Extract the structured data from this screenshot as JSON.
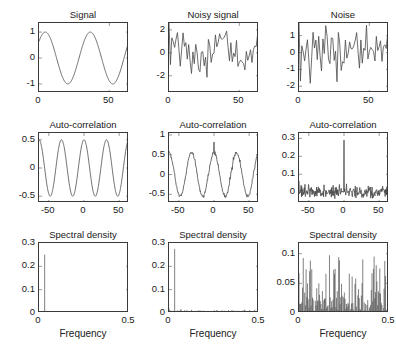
{
  "figure": {
    "rows": 3,
    "cols": 3,
    "background": "#ffffff",
    "line_color": "#4a4a4a",
    "axis_color": "#3a3a3a",
    "caption": ""
  },
  "chart_data": [
    {
      "id": "signal",
      "type": "line",
      "title": "Signal",
      "xlabel": "",
      "ylabel": "",
      "xlim": [
        0,
        64
      ],
      "ylim": [
        -1.35,
        1.35
      ],
      "xticks": [
        0,
        50
      ],
      "xticklabels": [
        "0",
        "50"
      ],
      "yticks": [
        -1,
        0,
        1
      ],
      "yticklabels": [
        "-1",
        "0",
        "1"
      ],
      "grid": false,
      "legend": "none",
      "description": "Pure sinusoid, about two cycles across 64 samples, amplitude 1",
      "series": [
        {
          "name": "signal",
          "generator": "sine",
          "amplitude": 1.0,
          "cycles": 2.0,
          "phase": 0.0,
          "n": 300
        }
      ]
    },
    {
      "id": "noisy-signal",
      "type": "line",
      "title": "Noisy signal",
      "xlabel": "",
      "ylabel": "",
      "xlim": [
        0,
        64
      ],
      "ylim": [
        -3.5,
        2.6
      ],
      "xticks": [
        0,
        50
      ],
      "xticklabels": [
        "0",
        "50"
      ],
      "yticks": [
        -2,
        0,
        2
      ],
      "yticklabels": [
        "-2",
        "0",
        "2"
      ],
      "grid": false,
      "legend": "none",
      "description": "Sinusoid plus white noise, amplitude 1 sine with noise sigma about 0.8",
      "series": [
        {
          "name": "signal+noise",
          "generator": "sine-plus-noise",
          "amplitude": 1.0,
          "cycles": 2.0,
          "noise_sigma": 0.85,
          "n": 65,
          "seed": 7
        }
      ]
    },
    {
      "id": "noise",
      "type": "line",
      "title": "Noise",
      "xlabel": "",
      "ylabel": "",
      "xlim": [
        0,
        64
      ],
      "ylim": [
        -2.4,
        1.75
      ],
      "xticks": [
        0,
        50
      ],
      "xticklabels": [
        "0",
        "50"
      ],
      "yticks": [
        -2,
        -1,
        0,
        1
      ],
      "yticklabels": [
        "-2",
        "-1",
        "0",
        "1"
      ],
      "grid": false,
      "legend": "none",
      "description": "White noise only, sigma about 0.8",
      "series": [
        {
          "name": "noise",
          "generator": "noise",
          "noise_sigma": 0.8,
          "n": 65,
          "seed": 7
        }
      ]
    },
    {
      "id": "autocorr-signal",
      "type": "line",
      "title": "Auto-correlation",
      "xlabel": "",
      "ylabel": "",
      "xlim": [
        -64,
        64
      ],
      "ylim": [
        -0.62,
        0.62
      ],
      "xticks": [
        -50,
        0,
        50
      ],
      "xticklabels": [
        "-50",
        "0",
        "50"
      ],
      "yticks": [
        -0.5,
        0,
        0.5
      ],
      "yticklabels": [
        "-0.5",
        "0",
        "0.5"
      ],
      "grid": false,
      "legend": "none",
      "description": "Triangular-windowed cosine autocorrelation of the pure sine, four visible cycles, peaks 0.5",
      "series": [
        {
          "name": "acf-signal",
          "generator": "cosine-acf",
          "amplitude": 0.5,
          "cycles_over_range": 4.0,
          "n": 400
        }
      ]
    },
    {
      "id": "autocorr-noisy",
      "type": "line",
      "title": "Auto-correlation",
      "xlabel": "",
      "ylabel": "",
      "xlim": [
        -64,
        64
      ],
      "ylim": [
        -0.72,
        1.05
      ],
      "xticks": [
        -50,
        0,
        50
      ],
      "xticklabels": [
        "-50",
        "0",
        "50"
      ],
      "yticks": [
        -0.5,
        0,
        0.5,
        1
      ],
      "yticklabels": [
        "-0.5",
        "0",
        "0.5",
        "1"
      ],
      "grid": false,
      "legend": "none",
      "description": "Cosine autocorrelation of the noisy signal with a narrow spike of 0.82 at lag 0",
      "series": [
        {
          "name": "acf-noisy",
          "generator": "cosine-acf-spike",
          "amplitude": 0.55,
          "cycles_over_range": 4.0,
          "spike_value": 0.82,
          "noise_sigma": 0.025,
          "n": 257,
          "seed": 11
        }
      ]
    },
    {
      "id": "autocorr-noise",
      "type": "line",
      "title": "Auto-correlation",
      "xlabel": "",
      "ylabel": "",
      "xlim": [
        -64,
        64
      ],
      "ylim": [
        -0.06,
        0.33
      ],
      "xticks": [
        -50,
        0,
        50
      ],
      "xticklabels": [
        "-50",
        "0",
        "50"
      ],
      "yticks": [
        0,
        0.1,
        0.2,
        0.3
      ],
      "yticklabels": [
        "0",
        "0.1",
        "0.2",
        "0.3"
      ],
      "grid": false,
      "legend": "none",
      "description": "Noise autocorrelation: flat noisy floor near 0 with a single spike of 0.29 at lag 0",
      "series": [
        {
          "name": "acf-noise",
          "generator": "noise-acf-spike",
          "spike_value": 0.29,
          "noise_sigma": 0.016,
          "n": 257,
          "seed": 3
        }
      ]
    },
    {
      "id": "psd-signal",
      "type": "line",
      "title": "Spectral density",
      "xlabel": "Frequency",
      "ylabel": "",
      "xlim": [
        0,
        0.5
      ],
      "ylim": [
        0,
        0.3
      ],
      "xticks": [
        0,
        0.5
      ],
      "xticklabels": [
        "0",
        "0.5"
      ],
      "yticks": [
        0,
        0.1,
        0.2,
        0.3
      ],
      "yticklabels": [
        "0",
        "0.1",
        "0.2",
        "0.3"
      ],
      "grid": false,
      "legend": "none",
      "description": "Single spectral line at frequency 0.031 with height 0.25, zero elsewhere",
      "series": [
        {
          "name": "psd-signal",
          "generator": "spike-only",
          "spike_freq": 0.031,
          "spike_value": 0.25,
          "floor": 0.0,
          "n": 128
        }
      ]
    },
    {
      "id": "psd-noisy",
      "type": "line",
      "title": "Spectral density",
      "xlabel": "Frequency",
      "ylabel": "",
      "xlim": [
        0,
        0.5
      ],
      "ylim": [
        0,
        0.3
      ],
      "xticks": [
        0,
        0.5
      ],
      "xticklabels": [
        "0",
        "0.5"
      ],
      "yticks": [
        0,
        0.1,
        0.2,
        0.3
      ],
      "yticklabels": [
        "0",
        "0.1",
        "0.2",
        "0.3"
      ],
      "grid": false,
      "legend": "none",
      "description": "Single spectral line at frequency 0.031 with height 0.275 over a low noise floor",
      "series": [
        {
          "name": "psd-noisy",
          "generator": "spike-plus-floor",
          "spike_freq": 0.031,
          "spike_value": 0.275,
          "floor": 0.006,
          "floor_sigma": 0.004,
          "n": 128,
          "seed": 5
        }
      ]
    },
    {
      "id": "psd-noise",
      "type": "line",
      "title": "Spectral density",
      "xlabel": "Frequency",
      "ylabel": "",
      "xlim": [
        0,
        0.5
      ],
      "ylim": [
        0,
        0.118
      ],
      "xticks": [
        0,
        0.5
      ],
      "xticklabels": [
        "0",
        "0.5"
      ],
      "yticks": [
        0,
        0.05,
        0.1
      ],
      "yticklabels": [
        "0",
        "0.05",
        "0.1"
      ],
      "grid": false,
      "legend": "none",
      "description": "Dense ragged white-noise periodogram filling 0 to 0.11, mean about 0.03, max about 0.105",
      "series": [
        {
          "name": "psd-noise",
          "generator": "exponential-periodogram",
          "mean": 0.03,
          "max": 0.105,
          "n": 128,
          "seed": 13
        }
      ]
    }
  ]
}
